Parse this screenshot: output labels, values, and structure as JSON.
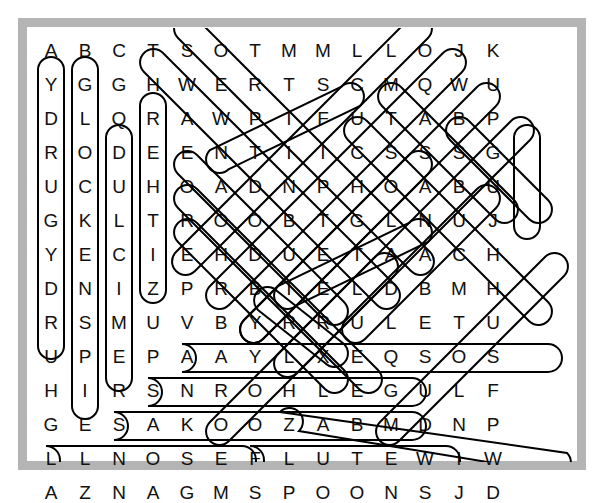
{
  "puzzle": {
    "title": "Musical Instruments Word Search",
    "columns": 14,
    "rows": 14,
    "grid": [
      [
        "A",
        "B",
        "C",
        "T",
        "S",
        "O",
        "T",
        "M",
        "M",
        "L",
        "L",
        "O",
        "J",
        "K"
      ],
      [
        "Y",
        "G",
        "G",
        "H",
        "W",
        "E",
        "R",
        "T",
        "S",
        "C",
        "M",
        "Q",
        "W",
        "U"
      ],
      [
        "D",
        "L",
        "Q",
        "R",
        "A",
        "W",
        "P",
        "I",
        "F",
        "U",
        "T",
        "A",
        "B",
        "P"
      ],
      [
        "R",
        "O",
        "D",
        "E",
        "E",
        "N",
        "T",
        "I",
        "I",
        "C",
        "S",
        "S",
        "S",
        "G"
      ],
      [
        "U",
        "C",
        "U",
        "H",
        "O",
        "A",
        "D",
        "N",
        "P",
        "H",
        "O",
        "A",
        "B",
        "U"
      ],
      [
        "G",
        "K",
        "L",
        "T",
        "R",
        "O",
        "O",
        "B",
        "T",
        "G",
        "L",
        "N",
        "U",
        "J"
      ],
      [
        "Y",
        "E",
        "C",
        "I",
        "E",
        "H",
        "D",
        "U",
        "E",
        "T",
        "A",
        "A",
        "C",
        "H"
      ],
      [
        "D",
        "N",
        "I",
        "Z",
        "P",
        "R",
        "B",
        "I",
        "E",
        "L",
        "D",
        "B",
        "M",
        "H"
      ],
      [
        "R",
        "S",
        "M",
        "U",
        "V",
        "B",
        "Y",
        "R",
        "R",
        "U",
        "L",
        "E",
        "T",
        "U"
      ],
      [
        "U",
        "P",
        "E",
        "P",
        "A",
        "A",
        "Y",
        "L",
        "X",
        "E",
        "Q",
        "S",
        "O",
        "S"
      ],
      [
        "H",
        "I",
        "R",
        "S",
        "N",
        "R",
        "O",
        "H",
        "L",
        "E",
        "G",
        "U",
        "L",
        "F"
      ],
      [
        "G",
        "E",
        "S",
        "A",
        "K",
        "O",
        "O",
        "Z",
        "A",
        "B",
        "M",
        "D",
        "N",
        "P"
      ],
      [
        "L",
        "L",
        "N",
        "O",
        "S",
        "E",
        "F",
        "L",
        "U",
        "T",
        "E",
        "W",
        "I",
        "W"
      ],
      [
        "A",
        "Z",
        "N",
        "A",
        "G",
        "M",
        "S",
        "P",
        "O",
        "O",
        "N",
        "S",
        "J",
        "D"
      ]
    ],
    "found_words": [
      {
        "word": "DRUGYDRUH",
        "label": "HURDY GURDY (reversed)",
        "direction": "vertical-up",
        "col": 0,
        "row_start": 1,
        "row_end": 10
      },
      {
        "word": "GLOCKENSPIEL",
        "label": "GLOCKENSPIEL",
        "direction": "vertical-down",
        "col": 1,
        "row_start": 1,
        "row_end": 12
      },
      {
        "word": "DULCIMERS",
        "label": "DULCIMERS",
        "direction": "vertical-down",
        "col": 2,
        "row_start": 3,
        "row_end": 11
      },
      {
        "word": "REHTIZ",
        "label": "ZITHER (reversed)",
        "direction": "vertical-up",
        "col": 3,
        "row_start": 2,
        "row_end": 7
      },
      {
        "word": "GUJ",
        "label": "JUG (reversed)",
        "direction": "vertical-up",
        "col": 13,
        "row_start": 3,
        "row_end": 5
      },
      {
        "word": "HARMONICAS",
        "label": "HARMONICAS (diagonal)",
        "direction": "diagonal-down-left",
        "col_start": 3,
        "row_start": 1,
        "col_end": 3,
        "row_end": 1
      },
      {
        "word": "NROHLEGUL F",
        "label": "FLUEGELHORN (reversed)",
        "direction": "horizontal-left",
        "row": 10,
        "col_start": 4,
        "col_end": 13
      },
      {
        "word": "AKOOZAB",
        "label": "BAZOOKA (reversed)",
        "direction": "horizontal-left",
        "row": 11,
        "col_start": 3,
        "col_end": 9
      },
      {
        "word": "NOSEFLUTE",
        "label": "NOSE FLUTE",
        "direction": "horizontal-right",
        "row": 12,
        "col_start": 2,
        "col_end": 10
      },
      {
        "word": "AZNAG",
        "label": "GANZA (reversed)",
        "direction": "horizontal-left",
        "row": 13,
        "col_start": 0,
        "col_end": 5
      },
      {
        "word": "SPOONS",
        "label": "SPOONS",
        "direction": "horizontal-right",
        "row": 13,
        "col_start": 6,
        "col_end": 11
      }
    ]
  },
  "style": {
    "frame_color": "#b4b4b4",
    "letter_color": "#111111",
    "mark_color": "#000000",
    "background": "#ffffff"
  }
}
